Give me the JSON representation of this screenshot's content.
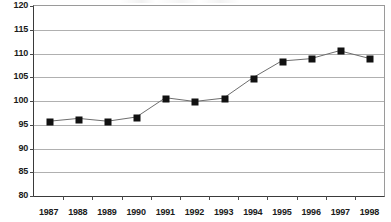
{
  "chart_data": {
    "type": "line",
    "title": "",
    "subtitle": "",
    "xlabel": "",
    "ylabel": "",
    "categories": [
      "1987",
      "1988",
      "1989",
      "1990",
      "1991",
      "1992",
      "1993",
      "1994",
      "1995",
      "1996",
      "1997",
      "1998"
    ],
    "values": [
      95.7,
      96.3,
      95.7,
      96.6,
      100.7,
      99.9,
      100.6,
      104.9,
      108.5,
      109.0,
      110.7,
      109.1
    ],
    "series": [
      {
        "name": "",
        "values": [
          95.7,
          96.3,
          95.7,
          96.6,
          100.7,
          99.9,
          100.6,
          104.9,
          108.5,
          109.0,
          110.7,
          109.1
        ]
      }
    ],
    "ylim": [
      80,
      120
    ],
    "ytick_values": [
      80,
      85,
      90,
      95,
      100,
      105,
      110,
      115,
      120
    ],
    "ytick_labels": [
      "80",
      "85",
      "90",
      "95",
      "100",
      "105",
      "110",
      "115",
      "120"
    ],
    "xtick_labels": [
      "1987",
      "1988",
      "1989",
      "1990",
      "1991",
      "1992",
      "1993",
      "1994",
      "1995",
      "1996",
      "1997",
      "1998"
    ],
    "grid": "horizontal",
    "legend": "none",
    "marker": "square",
    "marker_color": "#111111",
    "line_color": "#6b6b6b",
    "grid_color": "#b0b0b0",
    "axis_color": "#3a3a3a",
    "background_color": "#ffffff"
  }
}
